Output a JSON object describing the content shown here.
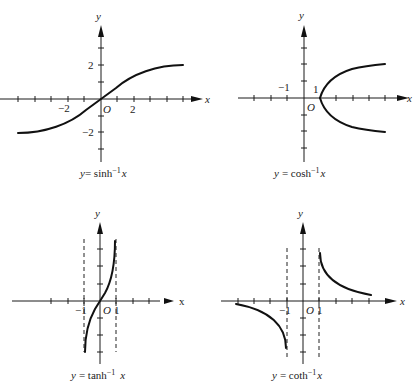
{
  "figure": {
    "panels": [
      {
        "id": "sinh",
        "caption_prefix": "y",
        "caption_eq": "= sinh",
        "caption_exp": "−1",
        "caption_var": "x",
        "axis_x_label": "x",
        "axis_y_label": "y",
        "origin_label": "O",
        "tick_labels": {
          "x_neg": "−2",
          "x_pos": "2",
          "y_pos": "2",
          "y_neg": "−2"
        }
      },
      {
        "id": "cosh",
        "caption_prefix": "y",
        "caption_eq": "= cosh",
        "caption_exp": "−1",
        "caption_var": "x",
        "axis_x_label": "x",
        "axis_y_label": "y",
        "origin_label": "O",
        "tick_labels": {
          "x_neg": "−1",
          "x_pos": "1"
        }
      },
      {
        "id": "tanh",
        "caption_prefix": "y",
        "caption_eq": "= tanh",
        "caption_exp": "−1",
        "caption_var": "x",
        "axis_x_label": "x",
        "axis_y_label": "y",
        "origin_label": "O",
        "tick_labels": {
          "x_neg": "−1",
          "x_pos": "1"
        }
      },
      {
        "id": "coth",
        "caption_prefix": "y",
        "caption_eq": "= coth",
        "caption_exp": "−1",
        "caption_var": "x",
        "axis_x_label": "x",
        "axis_y_label": "y",
        "origin_label": "O",
        "tick_labels": {
          "x_neg": "−1",
          "x_pos": "1"
        }
      }
    ]
  }
}
